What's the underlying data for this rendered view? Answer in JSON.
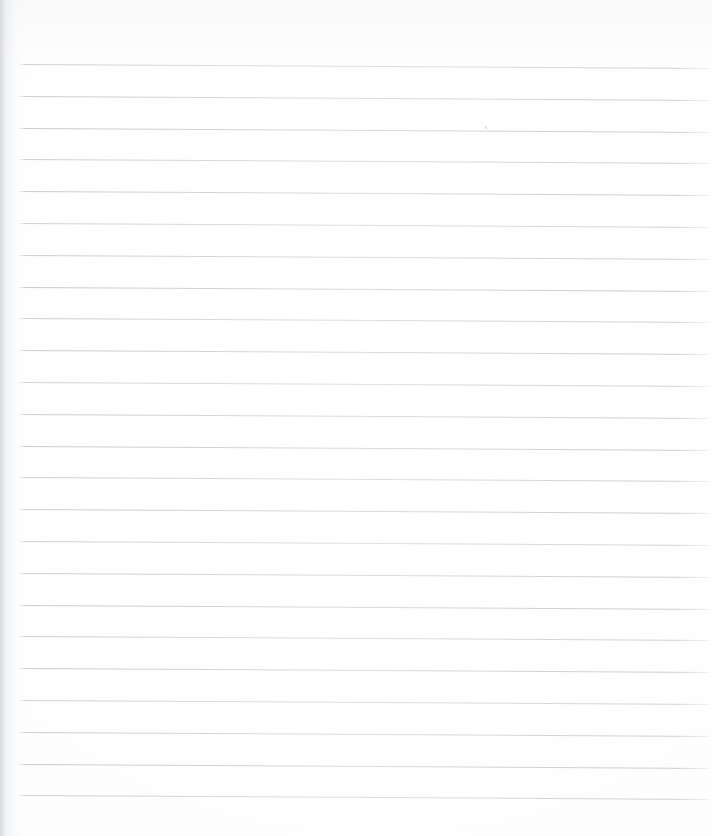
{
  "document": {
    "kind": "scanned-lined-notebook-page",
    "title": "Blank Lined Notebook Page",
    "written_content": "",
    "written_content_note": "No handwriting, no printed text, no headings, no page number, no marginalia visible anywhere on the page.",
    "page_width_px": 727,
    "page_height_px": 836
  },
  "paper": {
    "background_color": "#ffffff",
    "surface_tint_color": "#fcfcfd",
    "gutter_side": "left",
    "gutter_width_px": 26,
    "gutter_shadow_color": "#dee0e4",
    "gutter_crease_color": "#cdd0d5",
    "top_vignette_color": "#f8f8fa",
    "right_margin_width_px": 15
  },
  "ruling": {
    "style": "horizontal-ruled",
    "line_color": "#c5c8cd",
    "line_thickness_px": 1,
    "line_count": 24,
    "first_line_y_px": 64,
    "line_spacing_px": 31.8,
    "line_start_x_px": 18,
    "line_end_x_px": 710,
    "skew_degrees": 0.33,
    "skew_note": "Lines slope gently downward from left to right, about 4 px of drop across the full 692 px run — typical scanner/page-placement skew.",
    "line_y_positions": [
      64,
      95.8,
      127.6,
      159.4,
      191.2,
      223,
      254.8,
      286.6,
      318.4,
      350.2,
      382,
      413.8,
      445.6,
      477.4,
      509.2,
      541,
      572.8,
      604.6,
      636.4,
      668.2,
      700,
      731.8,
      763.6,
      795.4
    ]
  },
  "artifacts": {
    "specks": [
      {
        "x": 485,
        "y": 126
      }
    ]
  }
}
